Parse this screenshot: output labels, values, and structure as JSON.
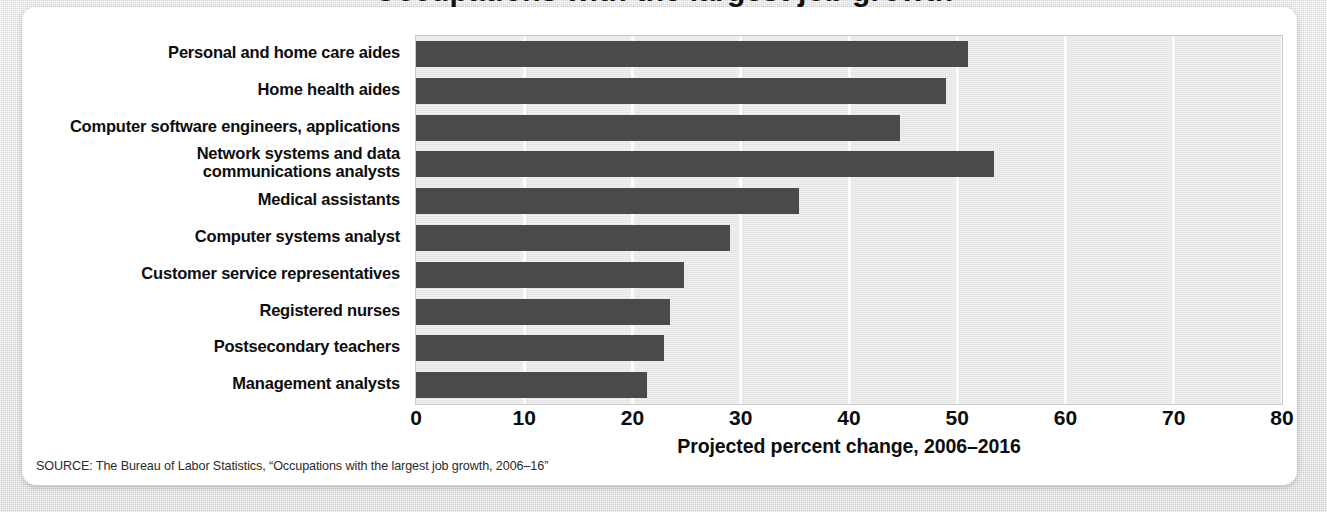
{
  "figure": {
    "title_cutoff": "Occupations with the largest job growth",
    "source_note": "SOURCE: The Bureau of Labor Statistics, “Occupations with the largest job growth, 2006–16”"
  },
  "colors": {
    "bar": "#4a4a4a",
    "plot_background": "#e7e7e7",
    "gridline": "#fbfbfb",
    "card": "#ffffff",
    "page_background": "#dcdcdc",
    "text": "#0d0d0d"
  },
  "chart_data": {
    "type": "bar",
    "orientation": "horizontal",
    "title": "",
    "xlabel": "Projected percent change, 2006–2016",
    "ylabel": "",
    "xlim": [
      0,
      80
    ],
    "xticks": [
      0,
      10,
      20,
      30,
      40,
      50,
      60,
      70,
      80
    ],
    "xticklabels": [
      "0",
      "10",
      "20",
      "30",
      "40",
      "50",
      "60",
      "70",
      "80"
    ],
    "grid": "vertical",
    "legend": "none",
    "categories": [
      "Personal and home care aides",
      "Home health aides",
      "Computer software engineers, applications",
      "Network systems and data communications analysts",
      "Medical assistants",
      "Computer systems analyst",
      "Customer service representatives",
      "Registered nurses",
      "Postsecondary teachers",
      "Management analysts"
    ],
    "category_lines": [
      [
        "Personal and home care aides"
      ],
      [
        "Home health aides"
      ],
      [
        "Computer software engineers, applications"
      ],
      [
        "Network systems and data",
        "communications analysts"
      ],
      [
        "Medical assistants"
      ],
      [
        "Computer systems analyst"
      ],
      [
        "Customer service representatives"
      ],
      [
        "Registered nurses"
      ],
      [
        "Postsecondary teachers"
      ],
      [
        "Management analysts"
      ]
    ],
    "values": [
      51,
      49,
      44.7,
      53.4,
      35.4,
      29,
      24.8,
      23.5,
      22.9,
      21.3
    ],
    "units": "percent"
  }
}
